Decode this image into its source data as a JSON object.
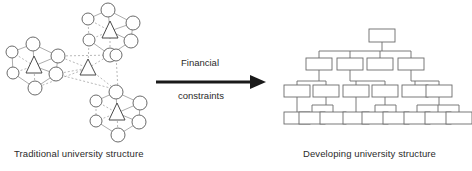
{
  "figure": {
    "width": 472,
    "height": 171,
    "background": "#ffffff",
    "type": "diagram",
    "kind": "organizational-transformation-diagram",
    "colors": {
      "node_stroke": "#5a5a5a",
      "edge_stroke": "#8a8a8a",
      "box_stroke": "#6b6b6b",
      "arrow": "#1a1a1a",
      "text": "#2b2b2b"
    }
  },
  "left": {
    "caption": "Traditional university structure",
    "description": "network of interconnected clusters",
    "clusters": [
      {
        "name": "cluster-left",
        "hub": {
          "shape": "triangle",
          "cx": 34,
          "cy": 66
        },
        "nodes": [
          {
            "cx": 33,
            "cy": 44,
            "r": 7
          },
          {
            "cx": 12,
            "cy": 52,
            "r": 6
          },
          {
            "cx": 58,
            "cy": 56,
            "r": 7
          },
          {
            "cx": 13,
            "cy": 73,
            "r": 6
          },
          {
            "cx": 56,
            "cy": 74,
            "r": 7
          },
          {
            "cx": 35,
            "cy": 88,
            "r": 7
          }
        ]
      },
      {
        "name": "cluster-top",
        "hub": {
          "shape": "triangle",
          "cx": 110,
          "cy": 31
        },
        "nodes": [
          {
            "cx": 108,
            "cy": 10,
            "r": 7
          },
          {
            "cx": 88,
            "cy": 19,
            "r": 6
          },
          {
            "cx": 133,
            "cy": 23,
            "r": 7
          },
          {
            "cx": 89,
            "cy": 40,
            "r": 6
          },
          {
            "cx": 131,
            "cy": 41,
            "r": 7
          },
          {
            "cx": 110,
            "cy": 55,
            "r": 7
          }
        ]
      },
      {
        "name": "cluster-center",
        "hub": {
          "shape": "triangle",
          "cx": 88,
          "cy": 68
        },
        "nodes": [
          {
            "cx": 116,
            "cy": 55,
            "r": 6
          },
          {
            "cx": 118,
            "cy": 90,
            "r": 6
          }
        ]
      },
      {
        "name": "cluster-bottom",
        "hub": {
          "shape": "triangle",
          "cx": 117,
          "cy": 113
        },
        "nodes": [
          {
            "cx": 116,
            "cy": 92,
            "r": 7
          },
          {
            "cx": 96,
            "cy": 101,
            "r": 6
          },
          {
            "cx": 140,
            "cy": 103,
            "r": 7
          },
          {
            "cx": 96,
            "cy": 121,
            "r": 6
          },
          {
            "cx": 139,
            "cy": 122,
            "r": 7
          },
          {
            "cx": 118,
            "cy": 135,
            "r": 7
          }
        ]
      }
    ]
  },
  "arrow": {
    "label_top": "Financial",
    "label_bottom": "constraints",
    "direction": "left-to-right",
    "x1": 156,
    "x2": 265,
    "y": 82
  },
  "right": {
    "caption": "Developing university structure",
    "description": "hierarchical tree organization chart",
    "levels": [
      {
        "level": 1,
        "box_count": 1
      },
      {
        "level": 2,
        "box_count": 4
      },
      {
        "level": 3,
        "box_count": 6
      },
      {
        "level": 4,
        "box_count": 9
      }
    ],
    "boxes": {
      "root": [
        {
          "x": 376,
          "y": 29
        }
      ],
      "level2": [
        {
          "x": 313,
          "y": 55
        },
        {
          "x": 344,
          "y": 55
        },
        {
          "x": 374,
          "y": 55
        },
        {
          "x": 405,
          "y": 55
        }
      ],
      "level3": [
        {
          "x": 291,
          "y": 82
        },
        {
          "x": 320,
          "y": 82
        },
        {
          "x": 350,
          "y": 82
        },
        {
          "x": 379,
          "y": 82
        },
        {
          "x": 409,
          "y": 82
        },
        {
          "x": 433,
          "y": 82
        }
      ],
      "level4": [
        {
          "x": 285,
          "y": 112
        },
        {
          "x": 306,
          "y": 112
        },
        {
          "x": 327,
          "y": 112
        },
        {
          "x": 348,
          "y": 112
        },
        {
          "x": 369,
          "y": 112
        },
        {
          "x": 390,
          "y": 112
        },
        {
          "x": 411,
          "y": 112
        },
        {
          "x": 432,
          "y": 112
        },
        {
          "x": 453,
          "y": 112
        }
      ]
    }
  }
}
